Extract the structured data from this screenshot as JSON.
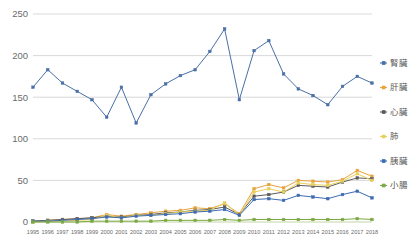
{
  "chart_data": {
    "type": "line",
    "title": "",
    "xlabel": "",
    "ylabel": "",
    "ylim": [
      0,
      250
    ],
    "yticks": [
      0,
      50,
      100,
      150,
      200,
      250
    ],
    "grid": true,
    "legend_position": "right",
    "categories": [
      "1995",
      "1996",
      "1997",
      "1998",
      "1999",
      "2000",
      "2001",
      "2002",
      "2003",
      "2004",
      "2005",
      "2006",
      "2007",
      "2008",
      "2009",
      "2010",
      "2011",
      "2012",
      "2013",
      "2014",
      "2015",
      "2016",
      "2017",
      "2018"
    ],
    "series": [
      {
        "name": "腎臟",
        "color": "#4a6fa5",
        "values": [
          162,
          183,
          167,
          157,
          147,
          126,
          162,
          119,
          153,
          166,
          176,
          183,
          205,
          232,
          147,
          206,
          218,
          178,
          160,
          152,
          141,
          163,
          175,
          167
        ]
      },
      {
        "name": "肝臟",
        "color": "#e8a33d",
        "values": [
          1,
          2,
          3,
          4,
          5,
          9,
          7,
          9,
          11,
          13,
          14,
          17,
          16,
          22,
          10,
          40,
          45,
          41,
          50,
          49,
          48,
          51,
          62,
          55
        ]
      },
      {
        "name": "心臟",
        "color": "#5b5b5b",
        "values": [
          1,
          2,
          3,
          4,
          5,
          7,
          6,
          8,
          9,
          11,
          12,
          14,
          15,
          18,
          9,
          31,
          33,
          36,
          44,
          43,
          42,
          48,
          53,
          52
        ]
      },
      {
        "name": "肺",
        "color": "#e8cf5a",
        "values": [
          0,
          1,
          1,
          2,
          3,
          8,
          5,
          8,
          8,
          10,
          12,
          13,
          14,
          23,
          8,
          36,
          40,
          36,
          47,
          45,
          44,
          49,
          58,
          50
        ]
      },
      {
        "name": "胰臟",
        "color": "#3d6bb3",
        "values": [
          1,
          1,
          2,
          3,
          4,
          6,
          5,
          7,
          8,
          9,
          10,
          12,
          13,
          15,
          8,
          27,
          28,
          26,
          32,
          30,
          28,
          33,
          37,
          29
        ]
      },
      {
        "name": "小腸",
        "color": "#7aa843",
        "values": [
          0,
          0,
          0,
          0,
          1,
          1,
          1,
          1,
          1,
          2,
          2,
          2,
          2,
          3,
          2,
          3,
          3,
          3,
          3,
          3,
          3,
          3,
          4,
          3
        ]
      }
    ]
  },
  "legend": {
    "items": [
      {
        "label": "腎臟",
        "color": "#4a6fa5"
      },
      {
        "label": "肝臟",
        "color": "#e8a33d"
      },
      {
        "label": "心臟",
        "color": "#5b5b5b"
      },
      {
        "label": "肺",
        "color": "#e8cf5a"
      },
      {
        "label": "胰臟",
        "color": "#3d6bb3"
      },
      {
        "label": "小腸",
        "color": "#7aa843"
      }
    ]
  }
}
